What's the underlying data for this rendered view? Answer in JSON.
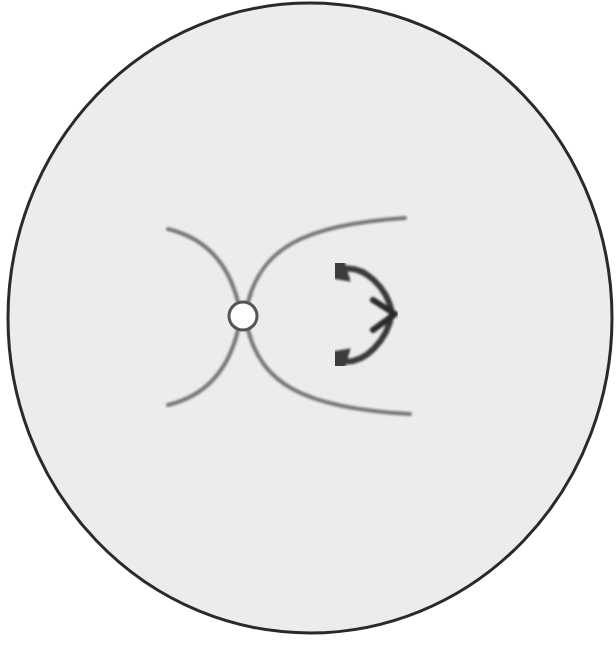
{
  "diagram": {
    "type": "schematic",
    "background": "#ffffff",
    "disk": {
      "cx": 310,
      "cy": 318,
      "rx": 302,
      "ry": 315,
      "fill": "#ececec",
      "stroke": "#2a2a2a",
      "stroke_width": 3
    },
    "pore": {
      "cx": 243,
      "cy": 316,
      "r": 14,
      "fill": "#ffffff",
      "stroke": "#555555"
    },
    "flow_lines": {
      "color": "#777777",
      "width": 4,
      "count": 4
    },
    "rotation_arrow": {
      "color": "#3a3a3a",
      "direction": "double-headed curved arrow, bending right with central chevron pointing right"
    },
    "labels": []
  }
}
